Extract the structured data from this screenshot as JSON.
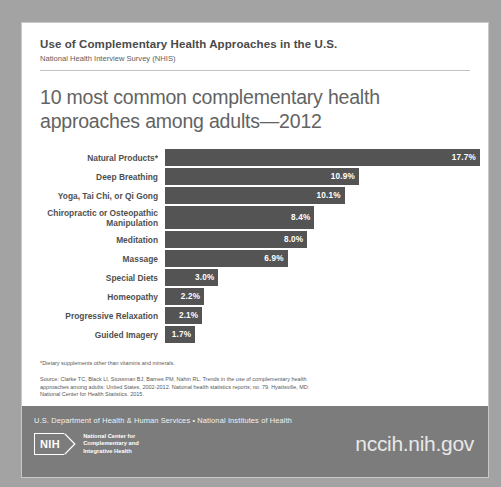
{
  "header": {
    "title": "Use of Complementary Health Approaches in the U.S.",
    "subtitle": "National Health Interview Survey (NHIS)"
  },
  "main": {
    "title": "10 most common complementary health approaches among adults—2012"
  },
  "chart_data": {
    "type": "bar",
    "orientation": "horizontal",
    "title": "10 most common complementary health approaches among adults—2012",
    "xlabel": "",
    "ylabel": "",
    "xlim": [
      0,
      17.7
    ],
    "grid": false,
    "legend": "none",
    "value_suffix": "%",
    "categories": [
      "Natural Products*",
      "Deep Breathing",
      "Yoga, Tai Chi, or Qi Gong",
      "Chiropractic or Osteopathic\nManipulation",
      "Meditation",
      "Massage",
      "Special Diets",
      "Homeopathy",
      "Progressive Relaxation",
      "Guided Imagery"
    ],
    "values": [
      17.7,
      10.9,
      10.1,
      8.4,
      8.0,
      6.9,
      3.0,
      2.2,
      2.1,
      1.7
    ],
    "labels": [
      "17.7%",
      "10.9%",
      "10.1%",
      "8.4%",
      "8.0%",
      "6.9%",
      "3.0%",
      "2.2%",
      "2.1%",
      "1.7%"
    ],
    "bar_color": "#545454",
    "value_label_color": "#ffffff"
  },
  "notes": {
    "footnote": "*Dietary supplements other than vitamins and minerals.",
    "source": "Source: Clarke TC, Black LI, Stussman BJ, Barnes PM, Nahin RL. Trends in the use of complementary health approaches among adults: United States, 2002-2012. National health statistics reports; no. 79. Hyattsville, MD: National Center for Health Statistics. 2015."
  },
  "footer": {
    "agency_line": "U.S. Department of Health & Human Services • National Institutes of Health",
    "nih_mark": "NIH",
    "center_name": "National Center for\nComplementary and\nIntegrative Health",
    "url": "nccih.nih.gov",
    "bar_color": "#7c7c7c"
  }
}
